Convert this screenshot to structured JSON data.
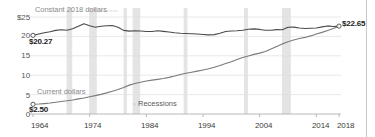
{
  "chart_data": {
    "type": "line",
    "title": "",
    "xlabel": "",
    "ylabel": "",
    "xlim": [
      1964,
      2018
    ],
    "ylim": [
      0,
      25
    ],
    "grid": true,
    "legend_position": "inline-labels",
    "y_ticks": [
      "$25",
      "20",
      "15",
      "10",
      "5",
      "0"
    ],
    "y_tick_values": [
      25,
      20,
      15,
      10,
      5,
      0
    ],
    "x_ticks": [
      "1964",
      "1974",
      "1984",
      "1994",
      "2004",
      "2014",
      "2018"
    ],
    "x_tick_values": [
      1964,
      1974,
      1984,
      1994,
      2004,
      2014,
      2018
    ],
    "annotations": {
      "start_constant": "$20.27",
      "start_current": "$2.50",
      "end_constant": "$22.65",
      "recessions_legend": "Recessions"
    },
    "series": [
      {
        "name": "Constant 2018 dollars",
        "label": "Constant 2018 dollars",
        "color": "#4a4a4a",
        "start_value": 20.27,
        "end_value": 22.65,
        "x": [
          1964,
          1965,
          1966,
          1967,
          1968,
          1969,
          1970,
          1971,
          1972,
          1973,
          1974,
          1975,
          1976,
          1977,
          1978,
          1979,
          1980,
          1981,
          1982,
          1983,
          1984,
          1985,
          1986,
          1987,
          1988,
          1989,
          1990,
          1991,
          1992,
          1993,
          1994,
          1995,
          1996,
          1997,
          1998,
          1999,
          2000,
          2001,
          2002,
          2003,
          2004,
          2005,
          2006,
          2007,
          2008,
          2009,
          2010,
          2011,
          2012,
          2013,
          2014,
          2015,
          2016,
          2017,
          2018
        ],
        "values": [
          20.27,
          20.6,
          20.95,
          21.2,
          21.55,
          21.7,
          21.6,
          21.95,
          22.6,
          23.25,
          22.75,
          22.35,
          22.6,
          22.75,
          22.8,
          22.35,
          21.55,
          21.35,
          21.45,
          21.4,
          21.25,
          21.25,
          21.45,
          21.3,
          21.15,
          20.95,
          20.8,
          20.75,
          20.7,
          20.6,
          20.5,
          20.4,
          20.45,
          20.8,
          21.25,
          21.4,
          21.45,
          21.6,
          21.85,
          21.95,
          21.8,
          21.6,
          21.6,
          21.75,
          21.7,
          22.35,
          22.4,
          22.15,
          22.05,
          22.1,
          22.15,
          22.45,
          22.7,
          22.55,
          22.65
        ]
      },
      {
        "name": "Current dollars",
        "label": "Current dollars",
        "color": "#7a7a7a",
        "start_value": 2.5,
        "end_value": 22.65,
        "x": [
          1964,
          1965,
          1966,
          1967,
          1968,
          1969,
          1970,
          1971,
          1972,
          1973,
          1974,
          1975,
          1976,
          1977,
          1978,
          1979,
          1980,
          1981,
          1982,
          1983,
          1984,
          1985,
          1986,
          1987,
          1988,
          1989,
          1990,
          1991,
          1992,
          1993,
          1994,
          1995,
          1996,
          1997,
          1998,
          1999,
          2000,
          2001,
          2002,
          2003,
          2004,
          2005,
          2006,
          2007,
          2008,
          2009,
          2010,
          2011,
          2012,
          2013,
          2014,
          2015,
          2016,
          2017,
          2018
        ],
        "values": [
          2.5,
          2.57,
          2.68,
          2.82,
          3.01,
          3.22,
          3.4,
          3.63,
          3.9,
          4.14,
          4.43,
          4.73,
          5.06,
          5.44,
          5.88,
          6.34,
          6.85,
          7.44,
          7.87,
          8.2,
          8.49,
          8.74,
          8.93,
          9.14,
          9.44,
          9.8,
          10.2,
          10.51,
          10.77,
          11.05,
          11.34,
          11.65,
          12.04,
          12.51,
          13.01,
          13.49,
          14.02,
          14.54,
          14.97,
          15.37,
          15.69,
          16.13,
          16.76,
          17.42,
          18.07,
          18.61,
          19.05,
          19.44,
          19.74,
          20.13,
          20.61,
          21.04,
          21.53,
          22.05,
          22.65
        ]
      }
    ],
    "recessions": [
      {
        "start": 1969.92,
        "end": 1970.92
      },
      {
        "start": 1973.92,
        "end": 1975.25
      },
      {
        "start": 1980.0,
        "end": 1980.58
      },
      {
        "start": 1981.58,
        "end": 1982.92
      },
      {
        "start": 1990.58,
        "end": 1991.25
      },
      {
        "start": 2001.25,
        "end": 2001.92
      },
      {
        "start": 2007.92,
        "end": 2009.5
      }
    ],
    "recession_band_color": "#e4e4e4",
    "gridline_color": "#e0e0e0",
    "axis_color": "#b0b0b0"
  }
}
